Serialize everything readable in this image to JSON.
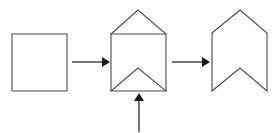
{
  "diagram": {
    "title": "Square to chevron shape transformation sequence",
    "canvas": {
      "width": 280,
      "height": 133,
      "background": "#ffffff"
    },
    "colors": {
      "shape_stroke": "#4a4a4a",
      "shape_fill": "#ffffff",
      "arrow": "#1a1a1a"
    },
    "steps": [
      {
        "index": 1,
        "name": "square",
        "label": "",
        "description": "Plain square outline",
        "bounds": {
          "x": 12,
          "y": 34,
          "width": 55,
          "height": 57
        },
        "outline_points": "12,34 67,34 67,91 12,91"
      },
      {
        "index": 2,
        "name": "square-with-roof-and-notch",
        "label": "",
        "description": "Square with triangular peak added on top and an inverted-V crease drawn inside the bottom",
        "bounds": {
          "x": 111,
          "y": 10,
          "width": 55,
          "height": 81
        },
        "outline_points": "111,34 138,10 166,34 166,91 111,91",
        "fold_lines": [
          "111,34 166,34",
          "111,91 138,68 166,91"
        ]
      },
      {
        "index": 3,
        "name": "chevron-bookmark",
        "label": "",
        "description": "Final chevron: pointed top peak and notched V cut out of the bottom edge",
        "bounds": {
          "x": 212,
          "y": 10,
          "width": 55,
          "height": 81
        },
        "outline_points": "212,33 240,10 267,33 267,91 240,68 212,91"
      }
    ],
    "arrows": [
      {
        "name": "arrow-step1-to-step2",
        "direction": "right",
        "label": "",
        "from_step": 1,
        "to_step": 2,
        "shaft": {
          "x1": 72,
          "y1": 62,
          "x2": 102,
          "y2": 62
        },
        "head_points": "102,57 110,62 102,67"
      },
      {
        "name": "arrow-step2-to-step3",
        "direction": "right",
        "label": "",
        "from_step": 2,
        "to_step": 3,
        "shaft": {
          "x1": 172,
          "y1": 62,
          "x2": 202,
          "y2": 62
        },
        "head_points": "202,57 210,62 202,67"
      },
      {
        "name": "arrow-input-to-step2",
        "direction": "up",
        "label": "",
        "from_step": null,
        "to_step": 2,
        "shaft": {
          "x1": 139,
          "y1": 132,
          "x2": 139,
          "y2": 101
        },
        "head_points": "134,101 139,93 144,101"
      }
    ]
  }
}
